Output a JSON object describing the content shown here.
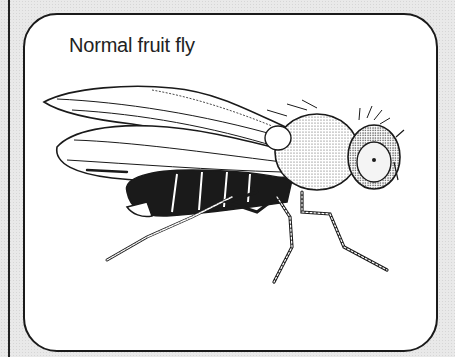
{
  "figure": {
    "title": "Normal fruit fly",
    "style": "black and white pen-and-ink drawing",
    "colors": {
      "background": "#e9e9e9",
      "panel": "#ffffff",
      "ink": "#1a1a1a"
    }
  }
}
